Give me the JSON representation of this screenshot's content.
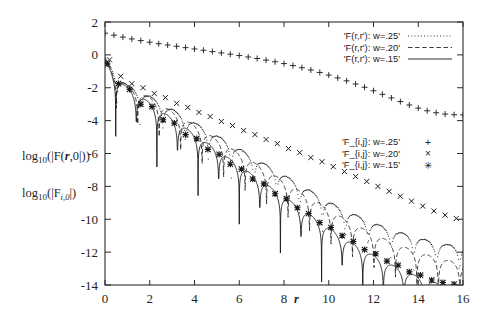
{
  "figure": {
    "background_color": "#ffffff",
    "frame_color": "#2a2a2a",
    "series_color": "#1a1a1a",
    "width": 480,
    "height": 327
  },
  "axis": {
    "x": {
      "label": "r",
      "ticks": [
        "0",
        "2",
        "4",
        "6",
        "8",
        "10",
        "12",
        "14",
        "16"
      ],
      "tick_values": [
        0,
        2,
        4,
        6,
        8,
        10,
        12,
        14,
        16
      ],
      "range": [
        0,
        16
      ]
    },
    "y": {
      "label_primary": "log",
      "label_primary_sub": "10",
      "label_primary_rest": "(|F(",
      "label_primary_bold": "r",
      "label_primary_tail": ",0|))",
      "label_secondary": "log",
      "label_secondary_sub": "10",
      "label_secondary_rest": "(|F",
      "label_secondary_fsub": "i,0",
      "label_secondary_tail": "|)",
      "ticks": [
        "2",
        "0",
        "-2",
        "-4",
        "-6",
        "-8",
        "-10",
        "-12",
        "-14"
      ],
      "tick_values": [
        2,
        0,
        -2,
        -4,
        -6,
        -8,
        -10,
        -12,
        -14
      ],
      "range": [
        -14,
        2
      ]
    }
  },
  "legend_lines": {
    "entries": [
      {
        "label": "'F(r,r'): w=.25'",
        "style": "dotted"
      },
      {
        "label": "'F(r,r'): w=.20'",
        "style": "dashed"
      },
      {
        "label": "'F(r,r'): w=.15'",
        "style": "solid"
      }
    ]
  },
  "legend_points": {
    "entries": [
      {
        "label": "'F_{i,j}: w=.25'",
        "marker": "+",
        "marker_name": "plus-marker"
      },
      {
        "label": "'F_{i,j}: w=.20'",
        "marker": "×",
        "marker_name": "cross-marker"
      },
      {
        "label": "'F_{i,j}: w=.15'",
        "marker": "✳",
        "marker_name": "asterisk-marker"
      }
    ]
  },
  "chart_data": {
    "type": "line",
    "title": "",
    "xlabel": "r",
    "ylabel": "log10(|F(r,0|)) , log10(|F_{i,0}|)",
    "xlim": [
      0,
      16
    ],
    "ylim": [
      -14,
      2
    ],
    "grid": false,
    "legend_position": "upper-right and middle-right",
    "xticks": [
      0,
      2,
      4,
      6,
      8,
      10,
      12,
      14,
      16
    ],
    "yticks": [
      2,
      0,
      -2,
      -4,
      -6,
      -8,
      -10,
      -12,
      -14
    ],
    "series": [
      {
        "name": "'F_{i,j}: w=.25'",
        "marker": "+",
        "style": "points",
        "x": [
          0,
          0.4,
          0.8,
          1.2,
          1.6,
          2.0,
          2.4,
          2.8,
          3.2,
          3.6,
          4.0,
          4.4,
          4.8,
          5.2,
          5.6,
          6.0,
          6.4,
          6.8,
          7.2,
          7.6,
          8.0,
          8.4,
          8.8,
          9.2,
          9.6,
          10.0,
          10.4,
          10.8,
          11.2,
          11.6,
          12.0,
          12.4,
          12.8,
          13.2,
          13.6,
          14.0,
          14.4,
          14.8,
          15.2,
          15.6,
          16.0
        ],
        "y": [
          1.32,
          1.2,
          1.08,
          0.97,
          0.87,
          0.77,
          0.68,
          0.6,
          0.52,
          0.44,
          0.36,
          0.28,
          0.2,
          0.12,
          0.04,
          -0.04,
          -0.13,
          -0.22,
          -0.32,
          -0.42,
          -0.53,
          -0.65,
          -0.78,
          -0.92,
          -1.07,
          -1.23,
          -1.4,
          -1.58,
          -1.77,
          -1.97,
          -2.18,
          -2.4,
          -2.62,
          -2.84,
          -3.05,
          -3.24,
          -3.4,
          -3.52,
          -3.6,
          -3.64,
          -3.65
        ]
      },
      {
        "name": "'F(r,r'): w=.25'",
        "style": "dotted",
        "comment": "oscillating envelope, shallow decay, deep notches at each minimum",
        "x": [
          0,
          0.5,
          1.0,
          1.5,
          2.0,
          2.5,
          3.0,
          3.5,
          4.0,
          4.5,
          5.0,
          5.5,
          6.0,
          6.5,
          7.0,
          7.5,
          8.0,
          8.5,
          9.0,
          9.5,
          10.0,
          10.5,
          11.0,
          11.5,
          12.0,
          12.5,
          13.0,
          13.5,
          14.0,
          14.5,
          15.0,
          15.5,
          16.0
        ],
        "envelope_y": [
          -0.2,
          -1.1,
          -1.85,
          -2.1,
          -2.5,
          -2.9,
          -3.3,
          -3.7,
          -4.1,
          -4.5,
          -4.9,
          -5.3,
          -5.7,
          -6.1,
          -6.5,
          -6.9,
          -7.3,
          -7.7,
          -8.1,
          -8.5,
          -8.9,
          -9.3,
          -9.6,
          -9.9,
          -10.2,
          -10.45,
          -10.7,
          -10.9,
          -11.1,
          -11.3,
          -11.45,
          -11.55,
          -11.6
        ]
      },
      {
        "name": "'F_{i,j}: w=.20'",
        "marker": "×",
        "style": "points",
        "x": [
          0.2,
          0.7,
          1.2,
          1.7,
          2.2,
          2.7,
          3.2,
          3.7,
          4.2,
          4.7,
          5.2,
          5.7,
          6.2,
          6.7,
          7.2,
          7.7,
          8.2,
          8.7,
          9.2,
          9.7,
          10.2,
          10.7,
          11.2,
          11.7,
          12.2,
          12.7,
          13.2,
          13.7,
          14.2,
          14.7,
          15.2,
          15.7
        ],
        "y": [
          -0.3,
          -1.3,
          -1.75,
          -2.0,
          -2.35,
          -2.6,
          -2.95,
          -3.2,
          -3.5,
          -3.75,
          -4.05,
          -4.3,
          -4.6,
          -4.85,
          -5.15,
          -5.4,
          -5.7,
          -5.95,
          -6.25,
          -6.5,
          -6.8,
          -7.1,
          -7.4,
          -7.7,
          -8.0,
          -8.3,
          -8.6,
          -8.9,
          -9.2,
          -9.5,
          -9.75,
          -9.95
        ]
      },
      {
        "name": "'F(r,r'): w=.20'",
        "style": "dashed",
        "x": [
          0,
          0.5,
          1.0,
          1.5,
          2.0,
          2.5,
          3.0,
          3.5,
          4.0,
          4.5,
          5.0,
          5.5,
          6.0,
          6.5,
          7.0,
          7.5,
          8.0,
          8.5,
          9.0,
          9.5,
          10.0,
          10.5,
          11.0,
          11.5,
          12.0,
          12.5,
          13.0,
          13.5,
          14.0,
          14.5,
          15.0,
          15.5,
          16.0
        ],
        "envelope_y": [
          -0.25,
          -1.2,
          -1.9,
          -2.2,
          -2.6,
          -3.0,
          -3.45,
          -3.85,
          -4.3,
          -4.7,
          -5.15,
          -5.55,
          -6.0,
          -6.4,
          -6.85,
          -7.25,
          -7.7,
          -8.1,
          -8.55,
          -8.95,
          -9.4,
          -9.8,
          -10.2,
          -10.55,
          -10.9,
          -11.2,
          -11.5,
          -11.75,
          -12.0,
          -12.2,
          -12.4,
          -12.55,
          -12.65
        ]
      },
      {
        "name": "'F_{i,j}: w=.15'",
        "marker": "✳",
        "style": "points",
        "x": [
          0.1,
          0.6,
          1.1,
          1.6,
          2.1,
          2.6,
          3.1,
          3.6,
          4.1,
          4.6,
          5.1,
          5.6,
          6.1,
          6.6,
          7.1,
          7.6,
          8.1,
          8.6,
          9.1,
          9.6,
          10.1,
          10.6,
          11.1,
          11.6,
          12.1,
          12.6,
          13.1,
          13.6,
          14.1,
          14.6,
          15.1,
          15.6
        ],
        "y": [
          -0.55,
          -1.75,
          -2.1,
          -3.0,
          -3.15,
          -3.95,
          -4.15,
          -4.85,
          -5.1,
          -5.75,
          -6.05,
          -6.65,
          -6.95,
          -7.55,
          -7.85,
          -8.45,
          -8.75,
          -9.3,
          -9.65,
          -10.2,
          -10.5,
          -11.0,
          -11.35,
          -11.85,
          -12.1,
          -12.55,
          -12.8,
          -13.2,
          -13.4,
          -13.7,
          -13.85,
          -13.95
        ]
      },
      {
        "name": "'F(r,r'): w=.15'",
        "style": "solid",
        "x": [
          0,
          0.5,
          1.0,
          1.5,
          2.0,
          2.5,
          3.0,
          3.5,
          4.0,
          4.5,
          5.0,
          5.5,
          6.0,
          6.5,
          7.0,
          7.5,
          8.0,
          8.5,
          9.0,
          9.5,
          10.0,
          10.5,
          11.0,
          11.5,
          12.0,
          12.5,
          13.0,
          13.5,
          14.0,
          14.5,
          15.0,
          15.5,
          16.0
        ],
        "envelope_y": [
          -0.3,
          -1.4,
          -2.0,
          -2.45,
          -2.9,
          -3.4,
          -3.85,
          -4.35,
          -4.8,
          -5.3,
          -5.75,
          -6.25,
          -6.7,
          -7.2,
          -7.65,
          -8.15,
          -8.6,
          -9.1,
          -9.55,
          -10.05,
          -10.5,
          -11.0,
          -11.4,
          -11.8,
          -12.2,
          -12.55,
          -12.9,
          -13.2,
          -13.5,
          -13.75,
          -13.95,
          -14.05,
          -14.1
        ]
      }
    ]
  }
}
